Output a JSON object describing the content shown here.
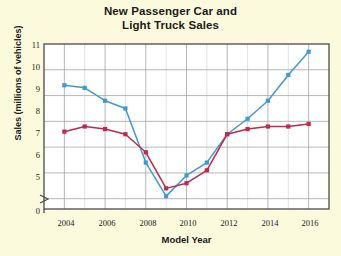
{
  "chart_data": {
    "type": "line",
    "title": "New Passenger Car and Light Truck Sales",
    "title_line1": "New Passenger Car and",
    "title_line2": "Light Truck Sales",
    "xlabel": "Model Year",
    "ylabel": "Sales (millions of vehicles)",
    "x": [
      2004,
      2005,
      2006,
      2007,
      2008,
      2009,
      2010,
      2011,
      2012,
      2013,
      2014,
      2015,
      2016
    ],
    "xlim": [
      2003,
      2017
    ],
    "ylim": [
      4.6,
      11
    ],
    "yticks": [
      0,
      5,
      6,
      7,
      8,
      9,
      10,
      11
    ],
    "xticks": [
      2004,
      2006,
      2008,
      2010,
      2012,
      2014,
      2016
    ],
    "axis_break": true,
    "grid": true,
    "legend": "inline-labels",
    "series": [
      {
        "name": "Trucks",
        "color": "#3f9ad4",
        "marker": "square",
        "values": [
          9.4,
          9.3,
          8.8,
          8.5,
          6.4,
          5.1,
          5.9,
          6.4,
          7.5,
          8.1,
          8.8,
          9.8,
          10.7
        ]
      },
      {
        "name": "Cars",
        "color": "#c0284c",
        "marker": "square",
        "values": [
          7.6,
          7.8,
          7.7,
          7.5,
          6.8,
          5.4,
          5.6,
          6.1,
          7.5,
          7.7,
          7.8,
          7.8,
          7.9
        ]
      }
    ]
  },
  "labels": {
    "trucks": "Trucks",
    "cars": "Cars"
  }
}
